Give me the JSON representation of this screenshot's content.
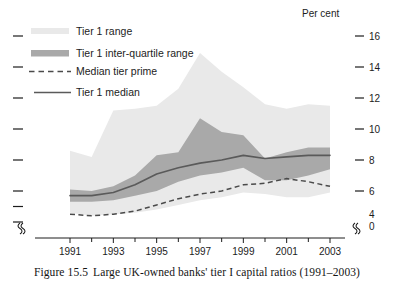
{
  "figure": {
    "caption_number": "Figure 15.5",
    "caption_text": "Large UK-owned banks' tier I capital ratios (1991–2003)",
    "unit_label": "Per cent"
  },
  "legend": {
    "items": [
      {
        "label": "Tier 1 range",
        "marker": "band",
        "color": "#e9e9e9"
      },
      {
        "label": "Tier 1 inter-quartile range",
        "marker": "band",
        "color": "#a9a9a9"
      },
      {
        "label": "Median tier prime",
        "marker": "dashed-line",
        "color": "#4a4a4a"
      },
      {
        "label": "Tier 1 median",
        "marker": "solid-line",
        "color": "#5a5a5a"
      }
    ]
  },
  "axes": {
    "y_unit": "Per cent",
    "y_ticks": [
      "16",
      "14",
      "12",
      "10",
      "8",
      "6",
      "4"
    ],
    "y_zero_label": "0",
    "y_break": true,
    "x_ticks": [
      "1991",
      "1993",
      "1995",
      "1997",
      "1999",
      "2001",
      "2003"
    ],
    "x_break_left": true,
    "x_break_right": true
  },
  "chart_data": {
    "type": "area",
    "title": "Large UK-owned banks' tier I capital ratios (1991–2003)",
    "xlabel": "",
    "ylabel": "Per cent",
    "ylim": [
      4,
      16
    ],
    "xlim": [
      1990.5,
      2003.5
    ],
    "grid": false,
    "legend_position": "top-left",
    "x": [
      1991,
      1992,
      1993,
      1994,
      1995,
      1996,
      1997,
      1998,
      1999,
      2000,
      2001,
      2002,
      2003
    ],
    "series": [
      {
        "name": "Tier 1 range",
        "type": "band",
        "color": "#e9e9e9",
        "upper": [
          8.6,
          8.2,
          11.2,
          11.3,
          11.5,
          12.6,
          14.9,
          13.7,
          12.7,
          11.6,
          11.3,
          11.6,
          11.5
        ],
        "lower": [
          4.6,
          4.4,
          4.5,
          4.6,
          4.8,
          5.1,
          5.4,
          5.6,
          5.9,
          5.8,
          5.6,
          5.6,
          5.9
        ]
      },
      {
        "name": "Tier 1 inter-quartile range",
        "type": "band",
        "color": "#a9a9a9",
        "upper": [
          6.1,
          6.0,
          6.3,
          7.0,
          8.3,
          8.5,
          10.7,
          9.8,
          9.6,
          8.1,
          8.5,
          8.8,
          8.8
        ],
        "lower": [
          5.3,
          5.3,
          5.4,
          5.7,
          6.0,
          6.6,
          7.0,
          7.2,
          7.5,
          6.7,
          6.7,
          7.0,
          7.4
        ]
      },
      {
        "name": "Tier 1 median",
        "type": "line",
        "style": "solid",
        "color": "#5a5a5a",
        "values": [
          5.7,
          5.7,
          5.9,
          6.4,
          7.1,
          7.5,
          7.8,
          8.0,
          8.3,
          8.1,
          8.2,
          8.3,
          8.3
        ]
      },
      {
        "name": "Median tier prime",
        "type": "line",
        "style": "dashed",
        "color": "#4a4a4a",
        "values": [
          4.5,
          4.4,
          4.5,
          4.7,
          5.1,
          5.5,
          5.8,
          6.0,
          6.4,
          6.5,
          6.8,
          6.6,
          6.3
        ]
      }
    ]
  }
}
